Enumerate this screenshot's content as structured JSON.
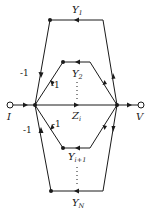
{
  "diagram": {
    "type": "signal-flow-graph",
    "input": {
      "label": "I"
    },
    "output": {
      "label": "V"
    },
    "branches": [
      {
        "label_main": "Y",
        "label_sub": "1",
        "position": "outer-top"
      },
      {
        "label_main": "Y",
        "label_sub": "2",
        "position": "inner-top"
      },
      {
        "label_main": "Z",
        "label_sub": "i",
        "position": "center"
      },
      {
        "label_main": "Y",
        "label_sub": "i+1",
        "position": "inner-bottom"
      },
      {
        "label_main": "Y",
        "label_sub": "N",
        "position": "outer-bottom"
      }
    ],
    "gains": [
      "-1",
      "-1",
      "-1",
      "-1"
    ],
    "colors": {
      "ink": "#1a1a1a",
      "background": "#ffffff"
    }
  }
}
